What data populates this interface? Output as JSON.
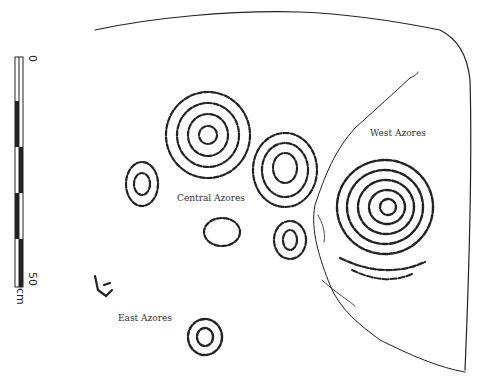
{
  "labels": {
    "central": "Central Azores",
    "west": "West Azores",
    "east": "East Azores"
  },
  "scale": {
    "start": "0",
    "end": "50",
    "unit": "cm"
  },
  "colors": {
    "ink": "#222222",
    "background": "#ffffff"
  }
}
